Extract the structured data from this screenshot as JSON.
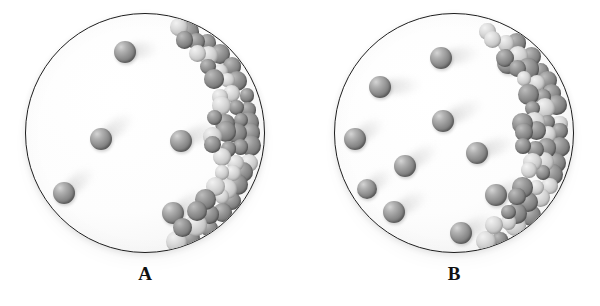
{
  "figure": {
    "type": "illustration",
    "background_color": "#ffffff",
    "vessel_outline_color": "#1d1d1d",
    "particle_color": "#8e8e8e",
    "packed_dark_color": "#7d7d7d",
    "packed_light_color": "#c2c2c2"
  },
  "panels": [
    {
      "id": "A",
      "label": "A",
      "circle": {
        "cx": 145,
        "cy": 133,
        "r": 120
      },
      "free_particle_count": 5,
      "free_particles": [
        {
          "x": 124,
          "y": 51,
          "r": 11,
          "trail_len": 34,
          "trail_angle": -8
        },
        {
          "x": 100,
          "y": 138,
          "r": 11,
          "trail_len": 40,
          "trail_angle": -38
        },
        {
          "x": 180,
          "y": 140,
          "r": 11,
          "trail_len": 44,
          "trail_angle": -22
        },
        {
          "x": 63,
          "y": 192,
          "r": 11,
          "trail_len": 38,
          "trail_angle": -40
        },
        {
          "x": 172,
          "y": 212,
          "r": 11,
          "trail_len": 40,
          "trail_angle": -30
        }
      ],
      "packed_cluster": {
        "position": "right-inner-wall",
        "shape": "crescent",
        "sphere_count": 34
      }
    },
    {
      "id": "B",
      "label": "B",
      "circle": {
        "cx": 454,
        "cy": 133,
        "r": 120
      },
      "free_particle_count": 11,
      "free_particles": [
        {
          "x": 440,
          "y": 57,
          "r": 11,
          "trail_len": 40,
          "trail_angle": -10
        },
        {
          "x": 507,
          "y": 62,
          "r": 11,
          "trail_len": 30,
          "trail_angle": -14
        },
        {
          "x": 379,
          "y": 86,
          "r": 11,
          "trail_len": 42,
          "trail_angle": -4
        },
        {
          "x": 442,
          "y": 120,
          "r": 11,
          "trail_len": 44,
          "trail_angle": -26
        },
        {
          "x": 354,
          "y": 138,
          "r": 11,
          "trail_len": 34,
          "trail_angle": -34
        },
        {
          "x": 404,
          "y": 165,
          "r": 11,
          "trail_len": 38,
          "trail_angle": -32
        },
        {
          "x": 476,
          "y": 152,
          "r": 11,
          "trail_len": 40,
          "trail_angle": -20
        },
        {
          "x": 393,
          "y": 211,
          "r": 11,
          "trail_len": 38,
          "trail_angle": -30
        },
        {
          "x": 460,
          "y": 232,
          "r": 11,
          "trail_len": 36,
          "trail_angle": -24
        },
        {
          "x": 495,
          "y": 194,
          "r": 11,
          "trail_len": 34,
          "trail_angle": -22
        },
        {
          "x": 366,
          "y": 188,
          "r": 10,
          "trail_len": 30,
          "trail_angle": -36
        }
      ],
      "packed_cluster": {
        "position": "right-inner-wall",
        "shape": "crescent",
        "sphere_count": 34
      }
    }
  ]
}
